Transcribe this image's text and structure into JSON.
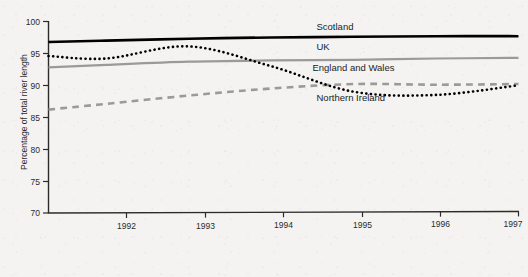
{
  "chart_data": {
    "type": "line",
    "title": "",
    "subtitle": "",
    "xlabel": "",
    "ylabel": "Percentage of total river length",
    "xlim": [
      1991.3,
      1997.0
    ],
    "ylim": [
      70,
      100
    ],
    "yticks": [
      70,
      75,
      80,
      85,
      90,
      95,
      100
    ],
    "ytick_labels": [
      "70",
      "75",
      "80",
      "85",
      "90",
      "95",
      "100"
    ],
    "xticks": [
      1992,
      1993,
      1994,
      1995,
      1996,
      1997
    ],
    "xtick_labels": [
      "1992",
      "1993",
      "1994",
      "1995",
      "1996",
      "1997"
    ],
    "grid": false,
    "legend_position": "inline-right",
    "x": [
      1991.3,
      1992,
      1993,
      1994,
      1995,
      1996,
      1997
    ],
    "series": [
      {
        "name": "Scotland",
        "label": "Scotland",
        "style": "solid",
        "color": "#000000",
        "width": 2.6,
        "values": [
          96.8,
          97.0,
          97.3,
          97.5,
          97.6,
          97.7,
          97.7
        ],
        "label_value": 98.6,
        "label_x": 1994.55
      },
      {
        "name": "UK",
        "label": "UK",
        "style": "solid",
        "color": "#9a9a9a",
        "width": 2.2,
        "values": [
          92.8,
          93.2,
          93.7,
          93.9,
          94.0,
          94.2,
          94.3
        ],
        "label_value": 95.6,
        "label_x": 1994.55
      },
      {
        "name": "England and Wales",
        "label": "England and Wales",
        "style": "dashed",
        "color": "#9a9a9a",
        "width": 2.6,
        "values": [
          86.2,
          87.1,
          88.4,
          89.5,
          90.2,
          90.1,
          90.2
        ],
        "label_value": 92.3,
        "label_x": 1994.5
      },
      {
        "name": "Northern Ireland",
        "label": "Northern Ireland",
        "style": "dotted",
        "color": "#000000",
        "width": 2.6,
        "values": [
          94.6,
          94.2,
          96.1,
          93.0,
          89.0,
          88.5,
          90.0
        ],
        "label_value": 87.6,
        "label_x": 1994.55
      }
    ]
  },
  "axes": {
    "y_axis_title": "Percentage of total river length",
    "y_tick_labels": [
      "100",
      "95",
      "90",
      "85",
      "80",
      "75",
      "70"
    ],
    "x_tick_labels": [
      "1992",
      "1993",
      "1994",
      "1995",
      "1996",
      "1997"
    ]
  },
  "colors": {
    "background": "#f4f3f1",
    "axis": "#2b2b2b",
    "black_series": "#000000",
    "gray_series": "#9a9a9a"
  }
}
